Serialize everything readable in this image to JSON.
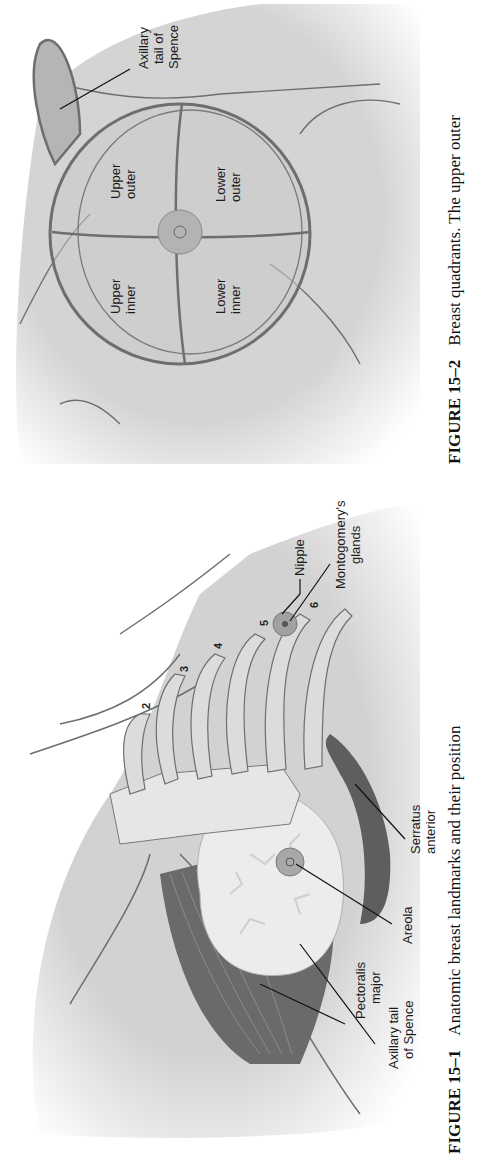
{
  "figures": [
    {
      "id": "fig-15-1",
      "caption": {
        "number": "FIGURE 15–1",
        "text": "Anatomic breast landmarks and their position"
      },
      "labels": {
        "pectoralis_major": [
          "Pectoralis",
          "major"
        ],
        "axillary_tail": [
          "Axillary tail",
          "of Spence"
        ],
        "areola": "Areola",
        "serratus_anterior": [
          "Serratus",
          "anterior"
        ],
        "nipple": "Nipple",
        "montgomery": [
          "Montogomery's",
          "glands"
        ]
      },
      "rib_numbers": [
        "2",
        "3",
        "4",
        "5",
        "6"
      ]
    },
    {
      "id": "fig-15-2",
      "caption": {
        "number": "FIGURE 15–2",
        "text": "Breast quadrants. The upper outer"
      },
      "labels": {
        "axillary_tail": [
          "Axillary",
          "tail of",
          "Spence"
        ],
        "upper_outer": [
          "Upper",
          "outer"
        ],
        "upper_inner": [
          "Upper",
          "inner"
        ],
        "lower_outer": [
          "Lower",
          "outer"
        ],
        "lower_inner": [
          "Lower",
          "inner"
        ]
      }
    }
  ],
  "colors": {
    "skin": "#d4d4d4",
    "skin_shadow": "#bdbdbd",
    "outline": "#6e6e6e",
    "muscle": "#6a6a6a",
    "gland": "#ececec",
    "text": "#1a1a1a"
  }
}
